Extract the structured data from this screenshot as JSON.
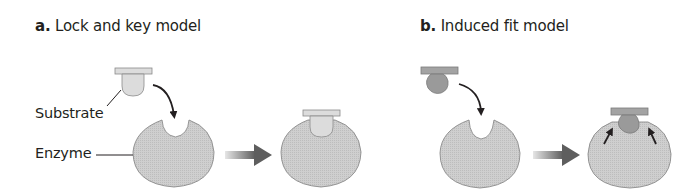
{
  "panels": [
    {
      "letter": "a.",
      "title": "Lock and key model"
    },
    {
      "letter": "b.",
      "title": "Induced fit model"
    }
  ],
  "labels": {
    "substrate": "Substrate",
    "enzyme": "Enzyme"
  },
  "colors": {
    "enzyme_fill": "#c9c9c9",
    "enzyme_edge": "#8a8a8a",
    "substrate_light": "#dcdcdc",
    "substrate_dark": "#9a9a9a",
    "arrow": "#231f20",
    "transition_arrow": "#6b6b6b"
  }
}
